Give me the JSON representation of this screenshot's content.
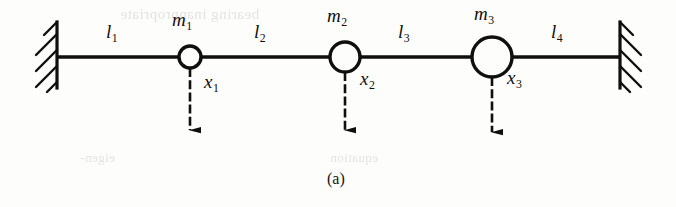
{
  "figure": {
    "caption": "(a)",
    "background_color": "#fdfdfc",
    "ink_color": "#100f0d",
    "type": "mass-spring-chain-diagram",
    "walls": [
      {
        "name": "left-wall",
        "side": "left",
        "x": 57,
        "y_top": 22,
        "y_bottom": 88
      },
      {
        "name": "right-wall",
        "side": "right",
        "x": 620,
        "y_top": 22,
        "y_bottom": 88
      }
    ],
    "rod": {
      "y": 57,
      "x_start": 57,
      "x_end": 620
    },
    "segments": [
      {
        "id": "l1",
        "label": "l",
        "subscript": "1",
        "label_x": 110,
        "label_y": 28
      },
      {
        "id": "l2",
        "label": "l",
        "subscript": "2",
        "label_x": 258,
        "label_y": 28
      },
      {
        "id": "l3",
        "label": "l",
        "subscript": "3",
        "label_x": 400,
        "label_y": 28
      },
      {
        "id": "l4",
        "label": "l",
        "subscript": "4",
        "label_x": 553,
        "label_y": 28
      }
    ],
    "masses": [
      {
        "id": "m1",
        "label": "m",
        "subscript": "1",
        "cx": 190,
        "cy": 57,
        "r": 11,
        "label_x": 173,
        "label_y": 14,
        "displacement": {
          "id": "x1",
          "label": "x",
          "subscript": "1",
          "label_x": 205,
          "label_y": 76,
          "arrow_x": 190,
          "arrow_y_start": 68,
          "arrow_y_end": 140
        }
      },
      {
        "id": "m2",
        "label": "m",
        "subscript": "2",
        "cx": 345,
        "cy": 57,
        "r": 15,
        "label_x": 328,
        "label_y": 10,
        "displacement": {
          "id": "x2",
          "label": "x",
          "subscript": "2",
          "label_x": 362,
          "label_y": 73,
          "arrow_x": 345,
          "arrow_y_start": 72,
          "arrow_y_end": 140
        }
      },
      {
        "id": "m3",
        "label": "m",
        "subscript": "3",
        "cx": 492,
        "cy": 57,
        "r": 20,
        "label_x": 475,
        "label_y": 8,
        "displacement": {
          "id": "x3",
          "label": "x",
          "subscript": "3",
          "label_x": 508,
          "label_y": 72,
          "arrow_x": 492,
          "arrow_y_start": 77,
          "arrow_y_end": 142
        }
      }
    ],
    "caption_x": 330,
    "caption_y": 176,
    "ghost_text": {
      "top": "bearing inappropriate",
      "bottom_left": "eigen-",
      "bottom_right": "equation"
    }
  }
}
